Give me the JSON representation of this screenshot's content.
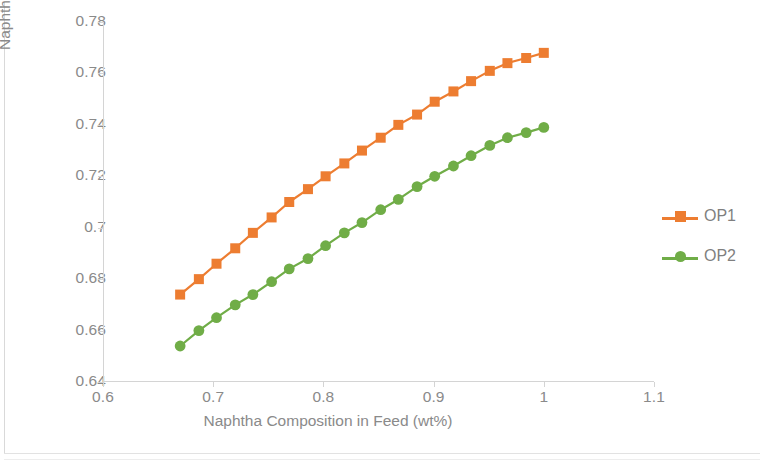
{
  "chart_data": {
    "type": "line",
    "title": "",
    "xlabel": "Naphtha Composition in Feed (wt%)",
    "ylabel": "Naphtha Recovery (units)",
    "xlim": [
      0.6,
      1.1
    ],
    "ylim": [
      0.64,
      0.78
    ],
    "xticks": [
      "0.6",
      "0.7",
      "0.8",
      "0.9",
      "1",
      "1.1"
    ],
    "xtick_values": [
      0.6,
      0.7,
      0.8,
      0.9,
      1.0,
      1.1
    ],
    "yticks": [
      "0.64",
      "0.66",
      "0.68",
      "0.7",
      "0.72",
      "0.74",
      "0.76",
      "0.78"
    ],
    "ytick_values": [
      0.64,
      0.66,
      0.68,
      0.7,
      0.72,
      0.74,
      0.76,
      0.78
    ],
    "grid": false,
    "legend_position": "right",
    "markers_visible": true,
    "series": [
      {
        "name": "OP1",
        "color": "#ed7d31",
        "marker": "square",
        "x": [
          0.67,
          0.687,
          0.703,
          0.72,
          0.736,
          0.753,
          0.769,
          0.786,
          0.802,
          0.819,
          0.835,
          0.852,
          0.868,
          0.885,
          0.901,
          0.918,
          0.934,
          0.951,
          0.967,
          0.984,
          1.0
        ],
        "values": [
          0.674,
          0.68,
          0.686,
          0.692,
          0.698,
          0.704,
          0.71,
          0.715,
          0.72,
          0.725,
          0.73,
          0.735,
          0.74,
          0.744,
          0.749,
          0.753,
          0.757,
          0.761,
          0.764,
          0.766,
          0.768
        ]
      },
      {
        "name": "OP2",
        "color": "#70ad47",
        "marker": "circle",
        "x": [
          0.67,
          0.687,
          0.703,
          0.72,
          0.736,
          0.753,
          0.769,
          0.786,
          0.802,
          0.819,
          0.835,
          0.852,
          0.868,
          0.885,
          0.901,
          0.918,
          0.934,
          0.951,
          0.967,
          0.984,
          1.0
        ],
        "values": [
          0.654,
          0.66,
          0.665,
          0.67,
          0.674,
          0.679,
          0.684,
          0.688,
          0.693,
          0.698,
          0.702,
          0.707,
          0.711,
          0.716,
          0.72,
          0.724,
          0.728,
          0.732,
          0.735,
          0.737,
          0.739
        ]
      }
    ]
  },
  "legend": {
    "entries": [
      {
        "label": "OP1"
      },
      {
        "label": "OP2"
      }
    ]
  }
}
